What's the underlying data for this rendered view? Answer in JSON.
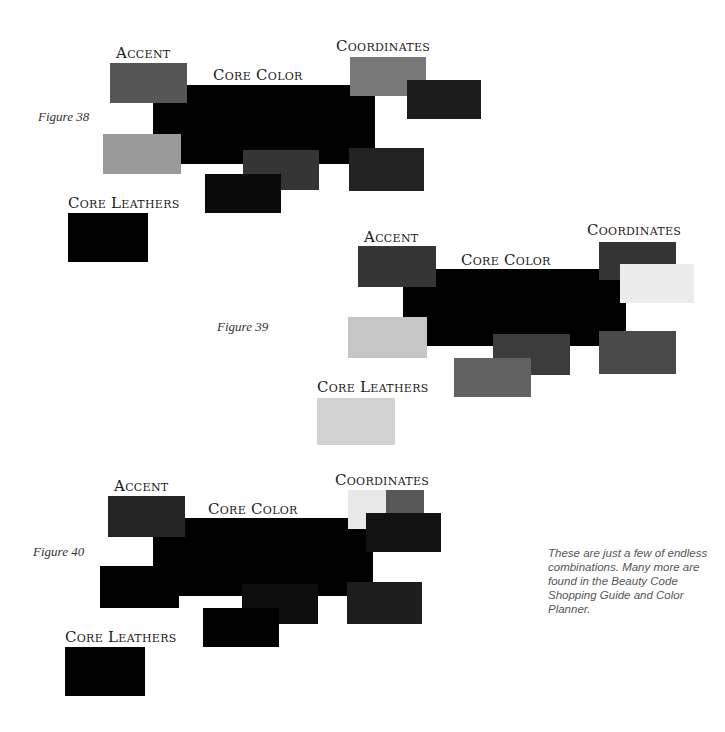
{
  "figures": [
    {
      "caption": "Figure 38",
      "labels": {
        "accent": "Accent",
        "core_color": "Core Color",
        "coordinates": "Coordinates",
        "core_leathers": "Core Leathers"
      },
      "swatch_colors": {
        "accent": "#565656",
        "core_color": "#000000",
        "coordinate_1": "#787878",
        "coordinate_2": "#1b1b1b",
        "left_light": "#9a9a9a",
        "center_mid": "#353535",
        "center_bottom": "#0a0a0a",
        "right": "#232323",
        "core_leathers": "#000000"
      }
    },
    {
      "caption": "Figure 39",
      "labels": {
        "accent": "Accent",
        "core_color": "Core Color",
        "coordinates": "Coordinates",
        "core_leathers": "Core Leathers"
      },
      "swatch_colors": {
        "accent": "#353535",
        "core_color": "#000000",
        "coordinate_1": "#353535",
        "coordinate_2": "#ececec",
        "left_light": "#c6c6c6",
        "center_mid": "#3c3c3c",
        "center_bottom": "#626262",
        "right": "#4a4a4a",
        "core_leathers": "#d2d2d2"
      }
    },
    {
      "caption": "Figure 40",
      "labels": {
        "accent": "Accent",
        "core_color": "Core Color",
        "coordinates": "Coordinates",
        "core_leathers": "Core Leathers"
      },
      "swatch_colors": {
        "accent": "#242424",
        "core_color": "#000000",
        "coordinate_light": "#e8e8e8",
        "coordinate_gray": "#575757",
        "coordinate_dark": "#121212",
        "left": "#000000",
        "center_mid": "#0e0e0e",
        "center_bottom": "#000000",
        "right": "#1d1d1d",
        "core_leathers": "#000000"
      }
    }
  ],
  "note": "These are just a few of endless combinations. Many more are found in the Beauty Code Shopping Guide and Color Planner."
}
